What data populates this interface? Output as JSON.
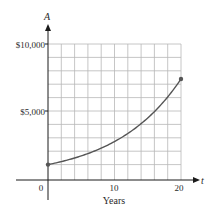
{
  "chart_data": {
    "type": "line",
    "title": "",
    "xlabel": "Years",
    "ylabel": "A",
    "x_axis_symbol": "t",
    "y_axis_symbol": "A",
    "xlim": [
      0,
      20
    ],
    "ylim": [
      0,
      10000
    ],
    "x_ticks": [
      0,
      10,
      20
    ],
    "x_tick_labels": [
      "0",
      "10",
      "20"
    ],
    "y_ticks": [
      5000,
      10000
    ],
    "y_tick_labels": [
      "$5,000",
      "$10,000"
    ],
    "grid": true,
    "grid_x_step": 2,
    "grid_y_step": 1000,
    "series": [
      {
        "name": "A(t)",
        "x": [
          0,
          2,
          4,
          6,
          8,
          10,
          12,
          14,
          16,
          18,
          20
        ],
        "values": [
          1000,
          1221,
          1492,
          1822,
          2226,
          2718,
          3320,
          4055,
          4953,
          6050,
          7389
        ]
      }
    ],
    "endpoints": [
      {
        "x": 0,
        "y": 1000
      },
      {
        "x": 20,
        "y": 7389
      }
    ]
  },
  "labels": {
    "y_symbol": "A",
    "x_symbol": "t",
    "y_tick_10000": "$10,000",
    "y_tick_5000": "$5,000",
    "x_tick_0": "0",
    "x_tick_10": "10",
    "x_tick_20": "20",
    "x_title": "Years"
  },
  "colors": {
    "curve": "#555555",
    "grid": "#b8b8b8",
    "axis": "#1a1a1a"
  }
}
